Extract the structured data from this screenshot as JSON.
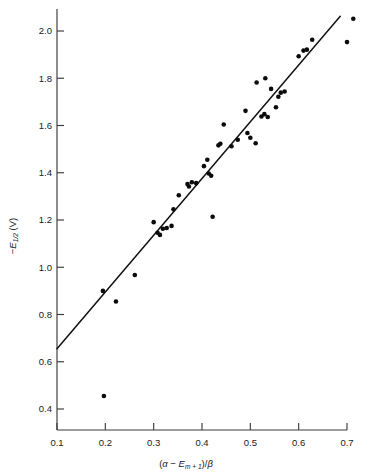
{
  "figure": {
    "title": "",
    "background_color": "#ffffff",
    "point_color": "#0b0b0b",
    "line_color": "#111111",
    "axis_color": "#3a3a3a"
  },
  "axes": {
    "x": {
      "label_plain": "(α − Em+1)/β",
      "label_parts": {
        "open": "(",
        "alpha": "α",
        "minus": " − ",
        "E": "E",
        "E_sub": "m + 1",
        "close": ")/",
        "beta": "β"
      },
      "ticks": [
        "0.1",
        "0.2",
        "0.3",
        "0.4",
        "0.5",
        "0.6",
        "0.7"
      ],
      "tick_values": [
        0.1,
        0.2,
        0.3,
        0.4,
        0.5,
        0.6,
        0.7
      ],
      "range": [
        0.1,
        0.7
      ]
    },
    "y": {
      "label_plain": "−E1/2 (V)",
      "label_parts": {
        "minus": "−",
        "E": "E",
        "E_sub": "1/2",
        "unit": " (V)"
      },
      "ticks": [
        "0.4",
        "0.6",
        "0.8",
        "1.0",
        "1.2",
        "1.4",
        "1.6",
        "1.8",
        "2.0"
      ],
      "tick_values": [
        0.4,
        0.6,
        0.8,
        1.0,
        1.2,
        1.4,
        1.6,
        1.8,
        2.0
      ],
      "range": [
        0.32,
        2.08
      ]
    }
  },
  "chart_data": {
    "type": "scatter",
    "title": "",
    "xlabel": "(α − Em+1)/β",
    "ylabel": "−E1/2 (V)",
    "xlim": [
      0.1,
      0.7
    ],
    "ylim": [
      0.32,
      2.08
    ],
    "grid": false,
    "legend": false,
    "series": [
      {
        "name": "measurements",
        "marker": "filled-circle",
        "marker_size_px": 4.6,
        "color": "#0b0b0b",
        "points": [
          [
            0.195,
            0.9
          ],
          [
            0.197,
            0.455
          ],
          [
            0.222,
            0.855
          ],
          [
            0.261,
            0.967
          ],
          [
            0.3,
            1.191
          ],
          [
            0.308,
            1.146
          ],
          [
            0.313,
            1.137
          ],
          [
            0.319,
            1.163
          ],
          [
            0.327,
            1.166
          ],
          [
            0.337,
            1.175
          ],
          [
            0.341,
            1.245
          ],
          [
            0.352,
            1.305
          ],
          [
            0.37,
            1.352
          ],
          [
            0.373,
            1.342
          ],
          [
            0.379,
            1.36
          ],
          [
            0.388,
            1.356
          ],
          [
            0.404,
            1.428
          ],
          [
            0.411,
            1.455
          ],
          [
            0.414,
            1.397
          ],
          [
            0.419,
            1.387
          ],
          [
            0.422,
            1.214
          ],
          [
            0.434,
            1.516
          ],
          [
            0.438,
            1.523
          ],
          [
            0.445,
            1.604
          ],
          [
            0.461,
            1.512
          ],
          [
            0.474,
            1.54
          ],
          [
            0.49,
            1.662
          ],
          [
            0.494,
            1.568
          ],
          [
            0.5,
            1.548
          ],
          [
            0.511,
            1.525
          ],
          [
            0.513,
            1.782
          ],
          [
            0.523,
            1.638
          ],
          [
            0.529,
            1.648
          ],
          [
            0.531,
            1.8
          ],
          [
            0.536,
            1.636
          ],
          [
            0.543,
            1.755
          ],
          [
            0.553,
            1.677
          ],
          [
            0.558,
            1.722
          ],
          [
            0.563,
            1.739
          ],
          [
            0.571,
            1.744
          ],
          [
            0.6,
            1.893
          ],
          [
            0.61,
            1.917
          ],
          [
            0.617,
            1.921
          ],
          [
            0.628,
            1.963
          ],
          [
            0.7,
            1.953
          ],
          [
            0.713,
            2.052
          ]
        ]
      }
    ],
    "fit_line": {
      "name": "least-squares line",
      "x_start": 0.1,
      "y_start": 0.655,
      "x_end": 0.686,
      "y_end": 2.062
    }
  }
}
